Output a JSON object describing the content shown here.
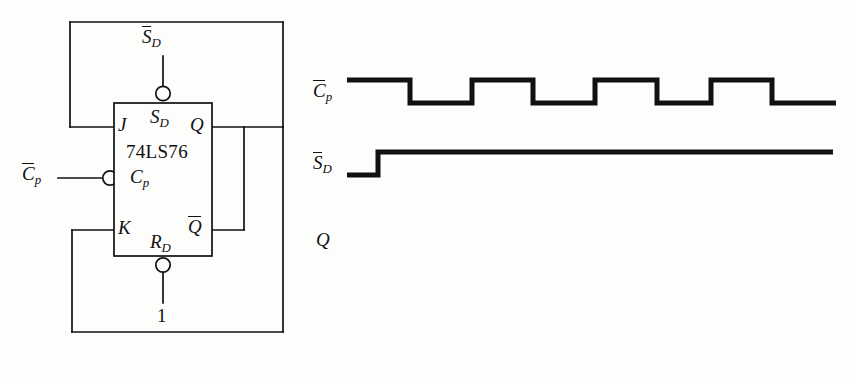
{
  "figure": {
    "type": "digital-logic-timing-figure",
    "background": "#fdfdfc",
    "ink": "#111111"
  },
  "circuit": {
    "chip_label": "74LS76",
    "pins": {
      "j": "J",
      "k": "K",
      "clock": "C",
      "clock_sub": "p",
      "set": "S",
      "set_sub": "D",
      "reset": "R",
      "reset_sub": "D",
      "q": "Q",
      "qbar": "Q"
    },
    "external": {
      "clock_input": "C",
      "clock_input_sub": "p",
      "set_input": "S",
      "set_input_sub": "D",
      "reset_value": "1"
    }
  },
  "timing": {
    "rows": [
      {
        "name": "clock-row",
        "label": "C",
        "label_sub": "p",
        "overbar": true
      },
      {
        "name": "set-row",
        "label": "S",
        "label_sub": "D",
        "overbar": true
      },
      {
        "name": "q-row",
        "label": "Q",
        "label_sub": "",
        "overbar": false
      }
    ]
  },
  "chart_data": {
    "type": "line",
    "title": "",
    "xlabel": "",
    "ylabel": "",
    "grid": false,
    "legend": "none",
    "series": [
      {
        "name": "Cp-bar",
        "label": "C̄p",
        "description": "inverted clock, starts high, five negative pulses",
        "y_high_px": 80,
        "y_low_px": 103,
        "x_start_px": 347,
        "x_end_px": 836,
        "transitions_px": [
          410,
          472,
          533,
          595,
          657,
          711,
          772
        ],
        "levels": [
          1,
          0,
          1,
          0,
          1,
          0,
          1,
          0
        ]
      },
      {
        "name": "Sd-bar",
        "label": "S̄D",
        "description": "active-low set, low then goes high and stays high",
        "y_high_px": 152,
        "y_low_px": 175,
        "x_start_px": 347,
        "x_end_px": 833,
        "transitions_px": [
          378
        ],
        "levels": [
          0,
          1
        ]
      },
      {
        "name": "Q",
        "label": "Q",
        "description": "output waveform not drawn (blank, to be filled in)",
        "y_high_px": 228,
        "y_low_px": 250,
        "x_start_px": 347,
        "x_end_px": 347,
        "transitions_px": [],
        "levels": []
      }
    ]
  }
}
